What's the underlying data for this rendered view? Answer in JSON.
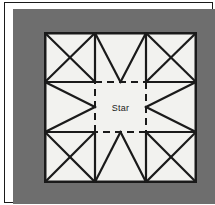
{
  "figure": {
    "kind": "quilt-block-diagram",
    "center_label": "Star",
    "mat_color": "#6e6e6e",
    "block_color": "#f2f2ef",
    "line_color": "#1a1a1a",
    "frame_color": "#1a1a1a",
    "page_background": "#ffffff"
  },
  "block": {
    "grid_rows": 3,
    "grid_cols": 3,
    "cells": [
      {
        "position": "top-left",
        "pattern": "x-cross",
        "name": "hourglass-x-block"
      },
      {
        "position": "top-center",
        "pattern": "v-down",
        "name": "chevron-down-block"
      },
      {
        "position": "top-right",
        "pattern": "x-cross",
        "name": "hourglass-x-block"
      },
      {
        "position": "middle-left",
        "pattern": "chevron-right",
        "name": "chevron-right-block"
      },
      {
        "position": "center",
        "pattern": "dashed-square",
        "name": "star-center-block"
      },
      {
        "position": "middle-right",
        "pattern": "chevron-left",
        "name": "chevron-left-block"
      },
      {
        "position": "bottom-left",
        "pattern": "x-cross",
        "name": "hourglass-x-block"
      },
      {
        "position": "bottom-center",
        "pattern": "v-up",
        "name": "chevron-up-block"
      },
      {
        "position": "bottom-right",
        "pattern": "x-cross",
        "name": "hourglass-x-block"
      }
    ]
  }
}
